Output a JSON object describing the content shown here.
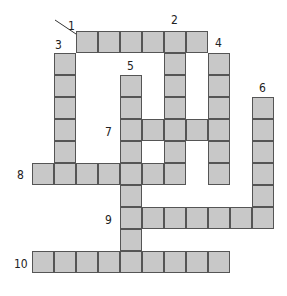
{
  "puzzle": {
    "type": "crossword",
    "cell_size": 22,
    "cell_color": "#c8c8c8",
    "border_color": "#555555",
    "words": [
      {
        "number": "1",
        "direction": "across",
        "x": 76,
        "y": 31,
        "length": 6,
        "label_x": 68,
        "label_y": 20
      },
      {
        "number": "2",
        "direction": "down",
        "x": 164,
        "y": 31,
        "length": 7,
        "label_x": 171,
        "label_y": 14
      },
      {
        "number": "3",
        "direction": "down",
        "x": 54,
        "y": 53,
        "length": 6,
        "label_x": 55,
        "label_y": 39
      },
      {
        "number": "4",
        "direction": "down",
        "x": 208,
        "y": 53,
        "length": 6,
        "label_x": 215,
        "label_y": 37
      },
      {
        "number": "5",
        "direction": "down",
        "x": 120,
        "y": 75,
        "length": 9,
        "label_x": 127,
        "label_y": 60
      },
      {
        "number": "6",
        "direction": "down",
        "x": 252,
        "y": 97,
        "length": 6,
        "label_x": 259,
        "label_y": 82
      },
      {
        "number": "7",
        "direction": "across",
        "x": 120,
        "y": 119,
        "length": 5,
        "label_x": 105,
        "label_y": 126
      },
      {
        "number": "8",
        "direction": "across",
        "x": 32,
        "y": 163,
        "length": 7,
        "label_x": 17,
        "label_y": 169
      },
      {
        "number": "9",
        "direction": "across",
        "x": 120,
        "y": 207,
        "length": 7,
        "label_x": 105,
        "label_y": 214
      },
      {
        "number": "10",
        "direction": "across",
        "x": 32,
        "y": 251,
        "length": 9,
        "label_x": 14,
        "label_y": 258
      }
    ]
  }
}
